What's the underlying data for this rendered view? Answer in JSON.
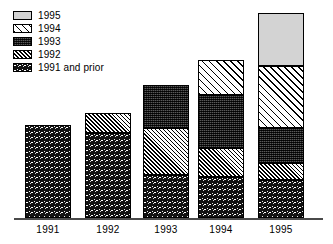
{
  "chart_data": {
    "type": "bar",
    "subtype": "stacked-vertical",
    "title": "",
    "subtitle": "",
    "xlabel": "",
    "ylabel": "",
    "grid": false,
    "axis_values_shown": false,
    "legend_position": "top-left",
    "categories": [
      "1991",
      "1992",
      "1993",
      "1994",
      "1995"
    ],
    "series": [
      {
        "name": "1991 and prior",
        "pattern": "dark-speckle",
        "values": [
          93,
          85,
          43,
          41,
          38
        ]
      },
      {
        "name": "1992",
        "pattern": "narrow-hatch",
        "values": [
          0,
          20,
          47,
          29,
          17
        ]
      },
      {
        "name": "1993",
        "pattern": "dark-checker",
        "values": [
          0,
          0,
          43,
          53,
          35
        ]
      },
      {
        "name": "1994",
        "pattern": "wide-diagonal",
        "values": [
          0,
          0,
          0,
          35,
          62
        ]
      },
      {
        "name": "1995",
        "pattern": "light-solid",
        "values": [
          0,
          0,
          0,
          0,
          53
        ]
      }
    ],
    "totals": [
      93,
      105,
      133,
      158,
      205
    ],
    "units": "pixels (no numeric axis shown)",
    "ylim": [
      0,
      210
    ],
    "colors": {
      "1995": "#d3d3d3",
      "1994": "#ffffff",
      "1993": "#3a3a3a",
      "1992": "#ffffff",
      "1991 and prior": "#121212",
      "outline": "#000000",
      "axis": "#4a4a4a",
      "background": "#ffffff"
    }
  },
  "legend": {
    "items": [
      {
        "label": "1995",
        "pattern_class": "pat-1995"
      },
      {
        "label": "1994",
        "pattern_class": "pat-1994"
      },
      {
        "label": "1993",
        "pattern_class": "pat-1993"
      },
      {
        "label": "1992",
        "pattern_class": "pat-1992"
      },
      {
        "label": "1991 and prior",
        "pattern_class": "pat-1991"
      }
    ]
  },
  "axis": {
    "tick_labels": [
      "1991",
      "1992",
      "1993",
      "1994",
      "1995"
    ]
  },
  "layout": {
    "bar_left": [
      25,
      85,
      143,
      198,
      258
    ],
    "bar_width": 46,
    "baseline_y": 218,
    "bars": [
      {
        "category": "1991",
        "segments": [
          {
            "series": "1991 and prior",
            "pattern_class": "pat-1991",
            "top": 125,
            "height": 93
          }
        ]
      },
      {
        "category": "1992",
        "segments": [
          {
            "series": "1992",
            "pattern_class": "pat-1992",
            "top": 113,
            "height": 20
          },
          {
            "series": "1991 and prior",
            "pattern_class": "pat-1991",
            "top": 133,
            "height": 85
          }
        ]
      },
      {
        "category": "1993",
        "segments": [
          {
            "series": "1993",
            "pattern_class": "pat-1993",
            "top": 85,
            "height": 43
          },
          {
            "series": "1992",
            "pattern_class": "pat-1992",
            "top": 128,
            "height": 47
          },
          {
            "series": "1991 and prior",
            "pattern_class": "pat-1991",
            "top": 175,
            "height": 43
          }
        ]
      },
      {
        "category": "1994",
        "segments": [
          {
            "series": "1994",
            "pattern_class": "pat-1994",
            "top": 60,
            "height": 35
          },
          {
            "series": "1993",
            "pattern_class": "pat-1993",
            "top": 95,
            "height": 53
          },
          {
            "series": "1992",
            "pattern_class": "pat-1992",
            "top": 148,
            "height": 29
          },
          {
            "series": "1991 and prior",
            "pattern_class": "pat-1991",
            "top": 177,
            "height": 41
          }
        ]
      },
      {
        "category": "1995",
        "segments": [
          {
            "series": "1995",
            "pattern_class": "pat-1995",
            "top": 13,
            "height": 53
          },
          {
            "series": "1994",
            "pattern_class": "pat-1994",
            "top": 66,
            "height": 62
          },
          {
            "series": "1993",
            "pattern_class": "pat-1993",
            "top": 128,
            "height": 35
          },
          {
            "series": "1992",
            "pattern_class": "pat-1992",
            "top": 163,
            "height": 17
          },
          {
            "series": "1991 and prior",
            "pattern_class": "pat-1991",
            "top": 180,
            "height": 38
          }
        ]
      }
    ]
  }
}
